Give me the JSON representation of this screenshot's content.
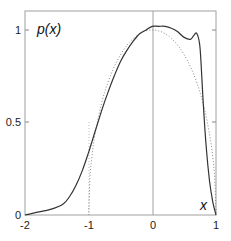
{
  "chart_data": {
    "type": "line",
    "title": "",
    "xlabel": "x",
    "ylabel": "p(x)",
    "xlim": [
      -2,
      1
    ],
    "ylim": [
      0,
      1.1
    ],
    "grid": false,
    "x_ticks": [
      "-2",
      "-1",
      "0",
      "1"
    ],
    "y_ticks": [
      "0",
      "0.5",
      "1"
    ],
    "vertical_reference_line_x": 0,
    "series": [
      {
        "name": "empirical density (solid)",
        "style": "solid",
        "x": [
          -2.0,
          -1.8,
          -1.6,
          -1.4,
          -1.3,
          -1.2,
          -1.1,
          -1.0,
          -0.9,
          -0.8,
          -0.7,
          -0.6,
          -0.5,
          -0.4,
          -0.3,
          -0.2,
          -0.1,
          0.0,
          0.1,
          0.2,
          0.3,
          0.4,
          0.5,
          0.6,
          0.65,
          0.7,
          0.75,
          0.8,
          0.85,
          0.9,
          0.95,
          1.0
        ],
        "values": [
          0.0,
          0.015,
          0.03,
          0.06,
          0.1,
          0.16,
          0.24,
          0.34,
          0.45,
          0.56,
          0.66,
          0.75,
          0.83,
          0.89,
          0.94,
          0.98,
          1.0,
          1.02,
          1.02,
          1.02,
          1.01,
          0.99,
          0.96,
          0.95,
          0.97,
          0.98,
          0.9,
          0.6,
          0.35,
          0.18,
          0.07,
          0.0
        ]
      },
      {
        "name": "semicircle sqrt(1-x^2) (dotted)",
        "style": "dotted",
        "x": [
          -1.0,
          -0.98,
          -0.95,
          -0.9,
          -0.8,
          -0.7,
          -0.6,
          -0.5,
          -0.4,
          -0.3,
          -0.2,
          -0.1,
          0.0,
          0.1,
          0.2,
          0.3,
          0.4,
          0.5,
          0.6,
          0.7,
          0.8,
          0.9,
          0.95,
          0.98,
          1.0
        ],
        "values": [
          0.0,
          0.199,
          0.312,
          0.436,
          0.6,
          0.714,
          0.8,
          0.866,
          0.917,
          0.954,
          0.98,
          0.995,
          1.0,
          0.995,
          0.98,
          0.954,
          0.917,
          0.866,
          0.8,
          0.714,
          0.6,
          0.436,
          0.312,
          0.199,
          0.0
        ]
      }
    ],
    "legend": "none"
  },
  "labels": {
    "ylabel": "p(x)",
    "xlabel": "x",
    "x_ticks": [
      "-2",
      "-1",
      "0",
      "1"
    ],
    "y_ticks": [
      "0",
      "0.5",
      "1"
    ]
  },
  "colors": {
    "axis": "#999999",
    "solid_line": "#333333",
    "dotted_line": "#888888"
  }
}
